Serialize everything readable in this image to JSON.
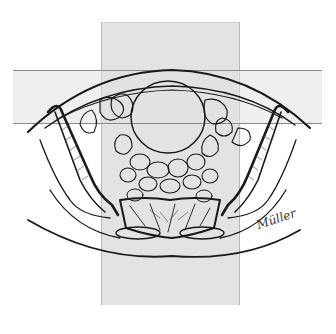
{
  "figure": {
    "type": "anatomical cross-section illustration",
    "overlays": [
      {
        "name": "vertical-field",
        "x": 101,
        "y": 22,
        "width": 137,
        "height": 282,
        "fill": "#e3e3e3"
      },
      {
        "name": "horizontal-field",
        "x": 13,
        "y": 70,
        "width": 309,
        "height": 52,
        "fill": "#e8e8e8"
      }
    ],
    "signature": "Müller",
    "colors": {
      "line": "#1a1a1a",
      "field_fill": "#e3e3e3",
      "background": "#ffffff"
    }
  }
}
